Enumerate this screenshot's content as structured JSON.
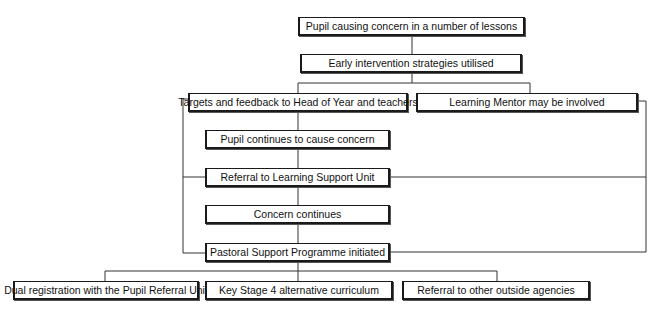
{
  "diagram": {
    "type": "flowchart",
    "nodes": [
      {
        "id": "n1",
        "label": "Pupil causing concern in a number of lessons"
      },
      {
        "id": "n2",
        "label": "Early intervention strategies utilised"
      },
      {
        "id": "n3",
        "label": "Targets and feedback to Head of Year and teachers"
      },
      {
        "id": "n4",
        "label": "Learning Mentor may be involved"
      },
      {
        "id": "n5",
        "label": "Pupil continues to cause concern"
      },
      {
        "id": "n6",
        "label": "Referral to Learning Support Unit"
      },
      {
        "id": "n7",
        "label": "Concern continues"
      },
      {
        "id": "n8",
        "label": "Pastoral Support Programme initiated"
      },
      {
        "id": "n9",
        "label": "Dual registration with the Pupil Referral Unit"
      },
      {
        "id": "n10",
        "label": "Key Stage 4 alternative curriculum"
      },
      {
        "id": "n11",
        "label": "Referral to other outside agencies"
      }
    ],
    "edges": [
      [
        "n1",
        "n2"
      ],
      [
        "n2",
        "n3"
      ],
      [
        "n2",
        "n4"
      ],
      [
        "n3",
        "n5"
      ],
      [
        "n5",
        "n6"
      ],
      [
        "n6",
        "n7"
      ],
      [
        "n7",
        "n8"
      ],
      [
        "n3",
        "n6"
      ],
      [
        "n3",
        "n8"
      ],
      [
        "n4",
        "n6"
      ],
      [
        "n4",
        "n8"
      ],
      [
        "n8",
        "n9"
      ],
      [
        "n8",
        "n10"
      ],
      [
        "n8",
        "n11"
      ]
    ]
  }
}
